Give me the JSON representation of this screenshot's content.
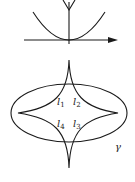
{
  "figure": {
    "top_panel": {
      "description": "parabola tangent to horizontal axis at origin with vertical axis",
      "axes": [
        "horizontal-axis-arrow",
        "vertical-axis-arrow"
      ]
    },
    "bottom_panel": {
      "curve_label": "γ",
      "region_labels": [
        {
          "base": "l",
          "sub": "1"
        },
        {
          "base": "l",
          "sub": "2"
        },
        {
          "base": "l",
          "sub": "3"
        },
        {
          "base": "l",
          "sub": "4"
        }
      ]
    }
  }
}
